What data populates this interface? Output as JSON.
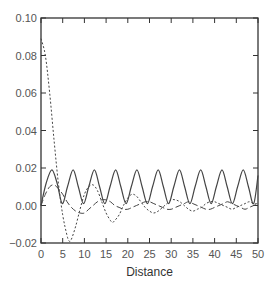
{
  "chart_data": {
    "type": "line",
    "title": "",
    "xlabel": "Distance",
    "ylabel": "",
    "xlim": [
      0,
      50
    ],
    "ylim": [
      -0.02,
      0.1
    ],
    "xticks": [
      0,
      5,
      10,
      15,
      20,
      25,
      30,
      35,
      40,
      45,
      50
    ],
    "yticks": [
      -0.02,
      0.0,
      0.02,
      0.04,
      0.06,
      0.08,
      0.1
    ],
    "xtick_labels": [
      "0",
      "5",
      "10",
      "15",
      "20",
      "25",
      "30",
      "35",
      "40",
      "45",
      "50"
    ],
    "ytick_labels": [
      "−0.02",
      "0.00",
      "0.02",
      "0.04",
      "0.06",
      "0.08",
      "0.10"
    ],
    "grid": false,
    "legend": null,
    "series": [
      {
        "name": "solid",
        "style": "solid",
        "x": [
          0,
          1.2,
          2.5,
          3.7,
          4.9,
          6.1,
          7.4,
          8.6,
          9.8,
          11.0,
          12.3,
          13.5,
          14.7,
          15.9,
          17.2,
          18.4,
          19.6,
          20.8,
          22.1,
          23.3,
          24.5,
          25.7,
          27.0,
          28.2,
          29.4,
          30.6,
          31.9,
          33.1,
          34.3,
          35.5,
          36.8,
          38.0,
          39.2,
          40.4,
          41.7,
          42.9,
          44.1,
          45.3,
          46.6,
          47.8,
          49.0,
          50
        ],
        "values": [
          0.0,
          0.012,
          0.019,
          0.012,
          0.001,
          0.01,
          0.019,
          0.01,
          0.001,
          0.01,
          0.019,
          0.01,
          0.001,
          0.01,
          0.019,
          0.01,
          0.001,
          0.01,
          0.019,
          0.01,
          0.001,
          0.01,
          0.019,
          0.01,
          0.001,
          0.01,
          0.019,
          0.01,
          0.001,
          0.01,
          0.019,
          0.01,
          0.001,
          0.01,
          0.019,
          0.01,
          0.001,
          0.01,
          0.019,
          0.01,
          0.001,
          0.016
        ]
      },
      {
        "name": "dotted",
        "style": "dotted",
        "x": [
          0,
          1,
          2,
          3,
          4,
          5,
          6,
          6.5,
          7,
          8,
          9,
          10,
          11,
          12,
          13,
          14,
          15,
          16,
          16.5,
          17,
          18,
          19,
          20,
          21,
          22,
          23,
          24,
          25,
          26,
          27,
          28,
          29,
          30,
          31,
          32,
          33,
          34,
          35,
          36,
          37,
          38,
          39,
          40,
          41,
          42,
          43,
          44,
          45,
          46,
          47,
          48,
          49,
          50
        ],
        "values": [
          0.089,
          0.08,
          0.06,
          0.035,
          0.012,
          -0.005,
          -0.016,
          -0.019,
          -0.018,
          -0.011,
          -0.002,
          0.006,
          0.01,
          0.011,
          0.008,
          0.002,
          -0.004,
          -0.008,
          -0.009,
          -0.008,
          -0.005,
          0.0,
          0.004,
          0.006,
          0.005,
          0.002,
          -0.001,
          -0.003,
          -0.004,
          -0.003,
          -0.001,
          0.001,
          0.003,
          0.003,
          0.002,
          0.0,
          -0.002,
          -0.003,
          -0.002,
          -0.001,
          0.001,
          0.002,
          0.002,
          0.001,
          0.0,
          -0.001,
          -0.002,
          -0.001,
          0.0,
          0.001,
          0.002,
          0.001,
          0.001
        ]
      },
      {
        "name": "dashed",
        "style": "dashed",
        "x": [
          0,
          1,
          2,
          3,
          4,
          5,
          6,
          7,
          8,
          9,
          10,
          11,
          12,
          13,
          14,
          15,
          16,
          17,
          18,
          19,
          20,
          21,
          22,
          23,
          24,
          25,
          26,
          27,
          28,
          29,
          30,
          31,
          32,
          33,
          34,
          35,
          36,
          37,
          38,
          39,
          40,
          41,
          42,
          43,
          44,
          45,
          46,
          47,
          48,
          49,
          50
        ],
        "values": [
          0.0,
          0.006,
          0.01,
          0.011,
          0.009,
          0.006,
          0.002,
          -0.001,
          -0.003,
          -0.004,
          -0.004,
          -0.002,
          0.0,
          0.002,
          0.003,
          0.003,
          0.002,
          0.0,
          -0.001,
          -0.002,
          -0.002,
          -0.001,
          0.0,
          0.001,
          0.002,
          0.002,
          0.001,
          0.0,
          -0.001,
          -0.002,
          -0.002,
          -0.001,
          0.0,
          0.001,
          0.002,
          0.001,
          0.0,
          -0.001,
          -0.002,
          -0.002,
          -0.001,
          0.0,
          0.001,
          0.002,
          0.001,
          0.0,
          -0.001,
          -0.002,
          -0.001,
          0.0,
          0.001
        ]
      }
    ]
  },
  "layout": {
    "plot_left": 41,
    "plot_right": 258,
    "plot_top": 18,
    "plot_bottom": 243,
    "line_color": "#444444",
    "axis_color": "#333333"
  }
}
